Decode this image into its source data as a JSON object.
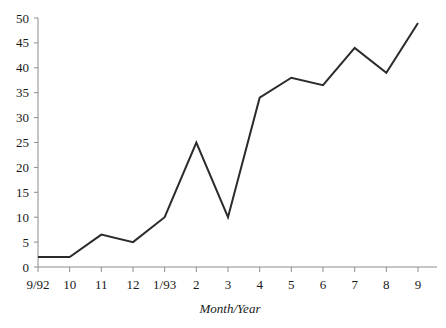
{
  "chart_data": {
    "type": "line",
    "title": "",
    "xlabel": "Month/Year",
    "ylabel": "",
    "categories": [
      "9/92",
      "10",
      "11",
      "12",
      "1/93",
      "2",
      "3",
      "4",
      "5",
      "6",
      "7",
      "8",
      "9"
    ],
    "values": [
      2,
      2,
      6.5,
      5,
      10,
      25,
      10,
      34,
      38,
      36.5,
      44,
      39,
      49
    ],
    "series": [
      {
        "name": "",
        "values": [
          2,
          2,
          6.5,
          5,
          10,
          25,
          10,
          34,
          38,
          36.5,
          44,
          39,
          49
        ]
      }
    ],
    "ylim": [
      0,
      50
    ],
    "y_ticks": [
      0,
      5,
      10,
      15,
      20,
      25,
      30,
      35,
      40,
      45,
      50
    ],
    "y_tick_labels": [
      "0",
      "5",
      "10",
      "15",
      "20",
      "25",
      "30",
      "35",
      "40",
      "45",
      "50"
    ],
    "x_tick_labels": [
      "9/92",
      "10",
      "11",
      "12",
      "1/93",
      "2",
      "3",
      "4",
      "5",
      "6",
      "7",
      "8",
      "9"
    ],
    "grid": false,
    "legend": null,
    "legend_position": "none",
    "line_color": "#2b2b2b",
    "axis_color": "#8c8c8c",
    "background_color": "#ffffff"
  }
}
